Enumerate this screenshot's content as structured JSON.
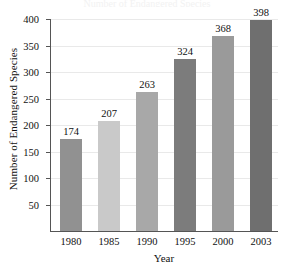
{
  "chart_data": {
    "type": "bar",
    "title": "",
    "xlabel": "Year",
    "ylabel": "Number of Endangered Species",
    "categories": [
      "1980",
      "1985",
      "1990",
      "1995",
      "2000",
      "2003"
    ],
    "values": [
      174,
      207,
      263,
      324,
      368,
      398
    ],
    "value_labels": [
      "174",
      "207",
      "263",
      "324",
      "368",
      "398"
    ],
    "bar_colors": [
      "#919191",
      "#c9c9c9",
      "#a8a8a8",
      "#7c7c7c",
      "#9a9a9a",
      "#6f6f6f"
    ],
    "ylim": [
      0,
      400
    ],
    "yticks": [
      50,
      100,
      150,
      200,
      250,
      300,
      350,
      400
    ],
    "ytick_labels": [
      "50",
      "100",
      "150",
      "200",
      "250",
      "300",
      "350",
      "400"
    ],
    "grid": true,
    "grid_color": "#e9e9e9",
    "axis_color": "#555555",
    "legend": null,
    "legend_position": "none",
    "background": "#ffffff"
  },
  "title_remnant": "Number of Endangered Species"
}
